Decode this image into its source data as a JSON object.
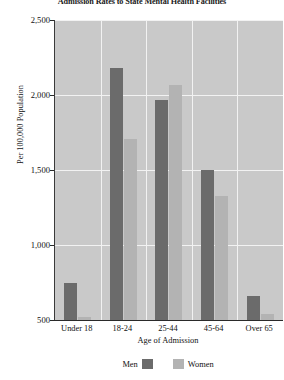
{
  "chart_data": {
    "type": "bar",
    "title": "Admission Rates to State Mental Health Facilities",
    "xlabel": "Age of Admission",
    "ylabel": "Per 100,000 Population",
    "categories": [
      "Under 18",
      "18-24",
      "25-44",
      "45-64",
      "Over 65"
    ],
    "series": [
      {
        "name": "Men",
        "color": "#6b6b6b",
        "values": [
          750,
          2180,
          1970,
          1500,
          660
        ]
      },
      {
        "name": "Women",
        "color": "#b3b3b3",
        "values": [
          520,
          1710,
          2070,
          1330,
          540
        ]
      }
    ],
    "ylim": [
      500,
      2500
    ],
    "yticks": [
      500,
      1000,
      1500,
      2000,
      2500
    ],
    "ytick_labels": [
      "500",
      "1,000",
      "1,500",
      "2,000",
      "2,500"
    ],
    "grid": true,
    "legend_position": "bottom",
    "plot_background": "#c9c9c9",
    "gridline_color": "#f2f2f2"
  },
  "legend": {
    "men_label": "Men",
    "women_label": "Women"
  }
}
